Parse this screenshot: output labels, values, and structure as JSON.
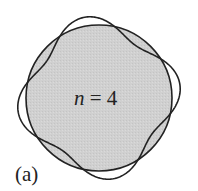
{
  "figure": {
    "panel_label": "(a)",
    "mode_label_var": "n",
    "mode_label_rest": " = 4",
    "mode_number": 4,
    "circle": {
      "cx": 99,
      "cy": 98,
      "r": 73,
      "fill": "#cfcfcf",
      "stroke": "#222222"
    },
    "perturbed_curve": {
      "amplitude": 9,
      "phase_deg": -10,
      "stroke": "#222222"
    }
  }
}
